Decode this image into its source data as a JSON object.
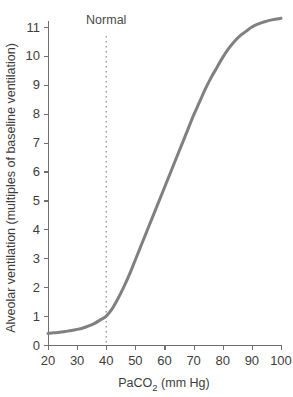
{
  "chart_data": {
    "type": "line",
    "title": "",
    "xlabel": "PaCO2 (mm Hg)",
    "xlabel_main": "PaCO",
    "xlabel_sub": "2",
    "xlabel_tail": " (mm Hg)",
    "ylabel": "Alveolar ventilation (multiples of baseline ventilation)",
    "xlim": [
      20,
      100
    ],
    "ylim": [
      0,
      11.6
    ],
    "xticks": [
      20,
      30,
      40,
      50,
      60,
      70,
      80,
      90,
      100
    ],
    "yticks": [
      0,
      1,
      2,
      3,
      4,
      5,
      6,
      7,
      8,
      9,
      10,
      11
    ],
    "xtick_labels": [
      "20",
      "30",
      "40",
      "50",
      "60",
      "70",
      "80",
      "90",
      "100"
    ],
    "ytick_labels": [
      "0",
      "1",
      "2",
      "3",
      "4",
      "5",
      "6",
      "7",
      "8",
      "9",
      "10",
      "11"
    ],
    "grid": false,
    "legend": false,
    "series": [
      {
        "name": "Alveolar ventilation response",
        "color": "#808080",
        "linewidth": 3,
        "x": [
          20,
          22,
          24,
          26,
          28,
          30,
          32,
          34,
          36,
          38,
          40,
          42,
          44,
          46,
          48,
          50,
          52,
          54,
          56,
          58,
          60,
          62,
          64,
          66,
          68,
          70,
          72,
          74,
          76,
          78,
          80,
          82,
          84,
          86,
          88,
          90,
          92,
          94,
          96,
          98,
          100
        ],
        "y": [
          0.4,
          0.42,
          0.44,
          0.47,
          0.5,
          0.54,
          0.59,
          0.66,
          0.75,
          0.87,
          1.0,
          1.25,
          1.6,
          2.0,
          2.45,
          2.95,
          3.45,
          3.95,
          4.45,
          4.95,
          5.45,
          5.95,
          6.45,
          6.95,
          7.45,
          7.95,
          8.4,
          8.85,
          9.25,
          9.6,
          9.95,
          10.25,
          10.5,
          10.7,
          10.85,
          11.0,
          11.1,
          11.17,
          11.23,
          11.27,
          11.3
        ]
      }
    ],
    "annotations": [
      {
        "name": "normal-reference",
        "label": "Normal",
        "x_value": 40,
        "style": "dotted-vertical-line",
        "color": "#9a9a9a",
        "label_y": 11.9
      }
    ]
  },
  "axis_color": "#6f6f6f"
}
